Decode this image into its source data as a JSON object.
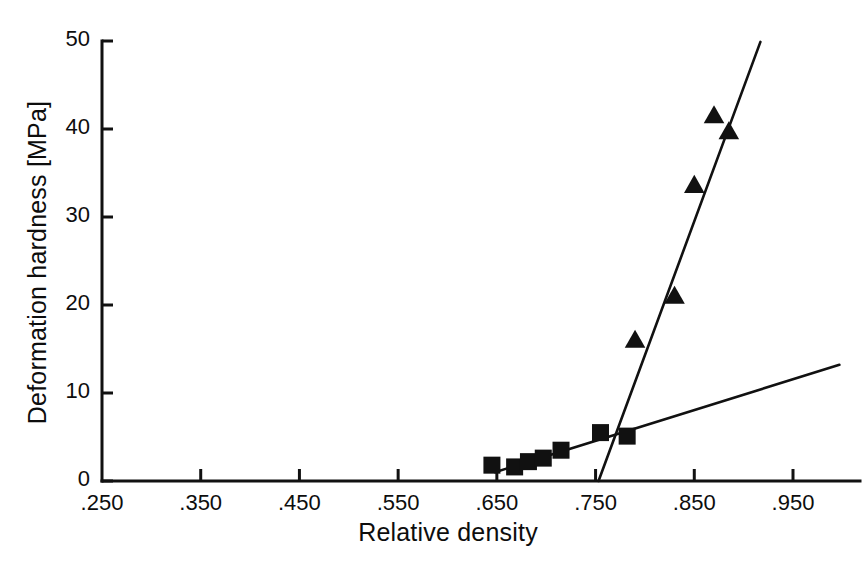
{
  "chart_data": {
    "type": "scatter",
    "title": "",
    "xlabel": "Relative density",
    "ylabel": "Deformation hardness [MPa]",
    "xlim": [
      0.25,
      0.99
    ],
    "ylim": [
      0,
      50
    ],
    "grid": false,
    "legend": "none",
    "xticks": [
      ".250",
      ".350",
      ".450",
      ".550",
      ".650",
      ".750",
      ".850",
      ".950"
    ],
    "xtick_values": [
      0.25,
      0.35,
      0.45,
      0.55,
      0.65,
      0.75,
      0.85,
      0.95
    ],
    "yticks": [
      "0",
      "10",
      "20",
      "30",
      "40",
      "50"
    ],
    "ytick_values": [
      0,
      10,
      20,
      30,
      40,
      50
    ],
    "series": [
      {
        "name": "low-density series",
        "marker": "square",
        "color": "#111111",
        "points": [
          {
            "x": 0.645,
            "y": 1.8
          },
          {
            "x": 0.668,
            "y": 1.6
          },
          {
            "x": 0.682,
            "y": 2.2
          },
          {
            "x": 0.697,
            "y": 2.6
          },
          {
            "x": 0.715,
            "y": 3.5
          },
          {
            "x": 0.755,
            "y": 5.5
          },
          {
            "x": 0.782,
            "y": 5.1
          }
        ]
      },
      {
        "name": "high-density series",
        "marker": "triangle",
        "color": "#111111",
        "points": [
          {
            "x": 0.79,
            "y": 16.0
          },
          {
            "x": 0.83,
            "y": 21.0
          },
          {
            "x": 0.85,
            "y": 33.6
          },
          {
            "x": 0.87,
            "y": 41.5
          },
          {
            "x": 0.885,
            "y": 39.7
          }
        ]
      }
    ],
    "fit_lines": [
      {
        "name": "shallow-fit-line",
        "x0": 0.648,
        "y0": 1.0,
        "x1": 0.997,
        "y1": 13.2
      },
      {
        "name": "steep-fit-line",
        "x0": 0.753,
        "y0": 0.0,
        "x1": 0.917,
        "y1": 49.9
      }
    ]
  }
}
